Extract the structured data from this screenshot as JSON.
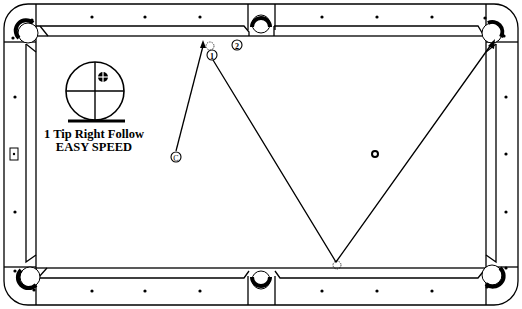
{
  "diagram": {
    "type": "billiards-shot-diagram",
    "cue_tip": {
      "spin_line": "1 Tip Right Follow",
      "speed_line": "EASY SPEED",
      "tip_position": "upper-right of center"
    },
    "balls": [
      {
        "id": "cue",
        "label": "C",
        "x": 175,
        "y": 157
      },
      {
        "id": "ball1",
        "label": "1",
        "x": 212,
        "y": 55
      },
      {
        "id": "ball2",
        "label": "2",
        "x": 237,
        "y": 45
      }
    ],
    "ghost_balls": [
      {
        "id": "ghost-at-1",
        "x": 210,
        "y": 46
      },
      {
        "id": "ghost-at-rail-bottom",
        "x": 337,
        "y": 264
      }
    ],
    "paths": [
      {
        "name": "cue-ball-path",
        "points": [
          [
            175,
            152
          ],
          [
            204,
            44
          ]
        ]
      },
      {
        "name": "object-ball-1-path",
        "points": [
          [
            213,
            59
          ],
          [
            336,
            262
          ],
          [
            494,
            42
          ]
        ]
      }
    ],
    "target_pocket": "top-right corner",
    "spot": {
      "x": 375,
      "y": 154
    },
    "colors": {
      "line": "#000000",
      "background": "#ffffff"
    }
  }
}
